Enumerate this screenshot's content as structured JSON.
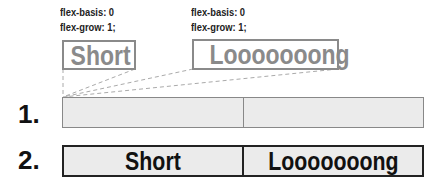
{
  "items": [
    {
      "basis_label": "flex-basis: 0",
      "grow_label": "flex-grow: 1;",
      "text": "Short"
    },
    {
      "basis_label": "flex-basis: 0",
      "grow_label": "flex-grow: 1;",
      "text": "Looooooong"
    }
  ],
  "steps": [
    {
      "number": "1.",
      "cells": [
        "",
        ""
      ]
    },
    {
      "number": "2.",
      "cells": [
        "Short",
        "Looooooong"
      ]
    }
  ],
  "colors": {
    "item_border": "#8a8a8a",
    "row_fill": "#ebebeb",
    "row2_border": "#222222",
    "dash": "#aaaaaa"
  }
}
